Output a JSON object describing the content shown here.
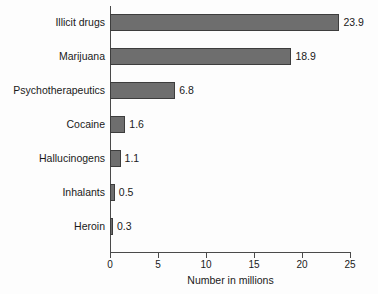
{
  "chart_data": {
    "type": "bar",
    "orientation": "horizontal",
    "title": "",
    "xlabel": "Number in millions",
    "ylabel": "",
    "xlim": [
      0,
      25
    ],
    "xticks": [
      0,
      5,
      10,
      15,
      20,
      25
    ],
    "xtick_labels": [
      "0",
      "5",
      "10",
      "15",
      "20",
      "25"
    ],
    "grid": false,
    "legend": false,
    "bar_color": "#6e6e6e",
    "bar_edge_color": "#3d3d3d",
    "axis_color": "#4a4a4a",
    "categories": [
      "Illicit drugs",
      "Marijuana",
      "Psychotherapeutics",
      "Cocaine",
      "Hallucinogens",
      "Inhalants",
      "Heroin"
    ],
    "values": [
      23.9,
      18.9,
      6.8,
      1.6,
      1.1,
      0.5,
      0.3
    ],
    "value_labels": [
      "23.9",
      "18.9",
      "6.8",
      "1.6",
      "1.1",
      "0.5",
      "0.3"
    ]
  }
}
